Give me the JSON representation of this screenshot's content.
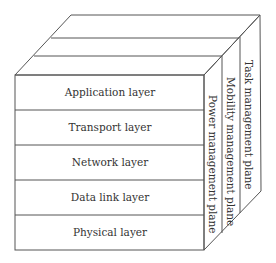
{
  "diagram": {
    "type": "3d-layer-cube",
    "layers": [
      {
        "label": "Application layer"
      },
      {
        "label": "Transport layer"
      },
      {
        "label": "Network layer"
      },
      {
        "label": "Data link layer"
      },
      {
        "label": "Physical layer"
      }
    ],
    "planes": [
      {
        "label": "Power management plane"
      },
      {
        "label": "Mobility management plane"
      },
      {
        "label": "Task management plane"
      }
    ],
    "colors": {
      "edge": "#555555",
      "text": "#333333",
      "background": "#ffffff"
    }
  }
}
